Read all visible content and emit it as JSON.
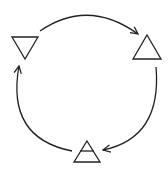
{
  "diagram": {
    "type": "cycle",
    "direction": "clockwise",
    "stroke_color": "#222222",
    "background": "#ffffff",
    "nodes": [
      {
        "id": "inverted-triangle",
        "shape": "triangle-down",
        "label": "inverted triangle",
        "position": "top-left"
      },
      {
        "id": "upright-triangle",
        "shape": "triangle-up",
        "label": "upright triangle",
        "position": "top-right"
      },
      {
        "id": "barred-triangle",
        "shape": "triangle-up-with-bar",
        "label": "triangle with horizontal bar",
        "position": "bottom"
      }
    ],
    "edges": [
      {
        "from": "inverted-triangle",
        "to": "upright-triangle",
        "style": "curved-arrow"
      },
      {
        "from": "upright-triangle",
        "to": "barred-triangle",
        "style": "curved-arrow"
      },
      {
        "from": "barred-triangle",
        "to": "inverted-triangle",
        "style": "curved-arrow"
      }
    ]
  }
}
